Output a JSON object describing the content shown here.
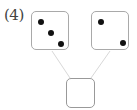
{
  "problem": {
    "number_label": "(4)",
    "left_die": {
      "value": 3,
      "dots": [
        [
          7,
          9
        ],
        [
          17,
          20
        ],
        [
          27,
          31
        ]
      ]
    },
    "right_die": {
      "value": 2,
      "dots": [
        [
          7,
          9
        ],
        [
          29,
          30
        ]
      ]
    },
    "answer_box": {
      "value": ""
    },
    "colors": {
      "box_border": "#a9a9a9",
      "dot": "#111111",
      "connector": "#d8d8d8"
    }
  }
}
